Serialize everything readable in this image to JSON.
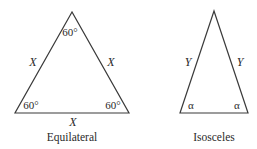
{
  "diagram": {
    "line_color": "#3a3a3a",
    "background": "#ffffff",
    "triangles": [
      {
        "name": "equilateral",
        "caption": "Equilateral",
        "vertices": {
          "apex": [
            72,
            12
          ],
          "left": [
            15,
            113
          ],
          "right": [
            129,
            113
          ]
        },
        "side_labels": {
          "left": "X",
          "right": "X",
          "base": "X"
        },
        "angle_labels": {
          "apex": "60°",
          "left": "60°",
          "right": "60°"
        }
      },
      {
        "name": "isosceles",
        "caption": "Isosceles",
        "vertices": {
          "apex": [
            214,
            11
          ],
          "left": [
            180,
            113
          ],
          "right": [
            248,
            113
          ]
        },
        "side_labels": {
          "left": "Y",
          "right": "Y"
        },
        "angle_labels": {
          "left": "α",
          "right": "α"
        }
      }
    ]
  }
}
